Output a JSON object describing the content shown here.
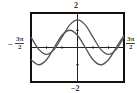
{
  "chart_data": {
    "type": "line",
    "title": "",
    "xlabel": "",
    "ylabel": "",
    "xlim": [
      -4.712389,
      4.712389
    ],
    "ylim": [
      -2,
      2
    ],
    "x_tick_labels": {
      "min": "−3π/2",
      "max": "3π/2"
    },
    "y_tick_labels": {
      "max": "2",
      "min": "−2"
    },
    "x_tick_step": 1.570796,
    "y_tick_step": 1,
    "grid": false,
    "legend": null,
    "series": [
      {
        "name": "curve-a",
        "description": "peaks at x=0 (~1.6), shallow minima at ±π (~−0.4)",
        "x": [
          -4.712,
          -3.927,
          -3.142,
          -2.356,
          -1.571,
          -0.785,
          0,
          0.785,
          1.571,
          2.356,
          3.142,
          3.927,
          4.712
        ],
        "y": [
          0.6,
          -0.11,
          -0.4,
          -0.11,
          0.6,
          1.31,
          1.6,
          1.31,
          0.6,
          -0.11,
          -0.4,
          -0.11,
          0.6
        ]
      },
      {
        "name": "curve-b",
        "description": "peaks at x=−π/4 (~1), minima at 3π/4 and −5π/4 (~−1)",
        "x": [
          -4.712,
          -3.927,
          -3.142,
          -2.356,
          -1.571,
          -0.785,
          0,
          0.785,
          1.571,
          2.356,
          3.142,
          3.927,
          4.712
        ],
        "y": [
          -0.71,
          -1.0,
          -0.71,
          0.0,
          0.71,
          1.0,
          0.71,
          0.0,
          -0.71,
          -1.0,
          -0.71,
          0.0,
          0.71
        ]
      }
    ]
  },
  "labels": {
    "y_max": "2",
    "y_min": "−2",
    "x_min_sign": "−",
    "x_min_num": "3π",
    "x_min_den": "2",
    "x_max_num": "3π",
    "x_max_den": "2"
  },
  "style": {
    "frame_color": "#111111",
    "curve_color": "#555555",
    "axis_color": "#222222"
  }
}
